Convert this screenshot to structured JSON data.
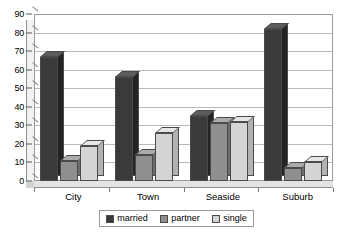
{
  "chart_data": {
    "type": "bar",
    "title": "",
    "xlabel": "",
    "ylabel": "",
    "categories": [
      "City",
      "Town",
      "Seaside",
      "Suburb"
    ],
    "series": [
      {
        "name": "married",
        "color": "#3a3a3a",
        "values": [
          67,
          56,
          35,
          82
        ]
      },
      {
        "name": "partner",
        "color": "#8f8f8f",
        "values": [
          11,
          14,
          31,
          7
        ]
      },
      {
        "name": "single",
        "color": "#d4d4d4",
        "values": [
          19,
          26,
          32,
          10
        ]
      }
    ],
    "ylim": [
      0,
      90
    ],
    "ytick_step": 10,
    "yticks": [
      "0",
      "10",
      "20",
      "30",
      "40",
      "50",
      "60",
      "70",
      "80",
      "90"
    ],
    "grid": "horizontal",
    "legend_position": "bottom",
    "style": "3d-column"
  },
  "legend": {
    "items": [
      {
        "label": "married",
        "swatch": "married-swatch"
      },
      {
        "label": "partner",
        "swatch": "partner-swatch"
      },
      {
        "label": "single",
        "swatch": "single-swatch"
      }
    ]
  }
}
